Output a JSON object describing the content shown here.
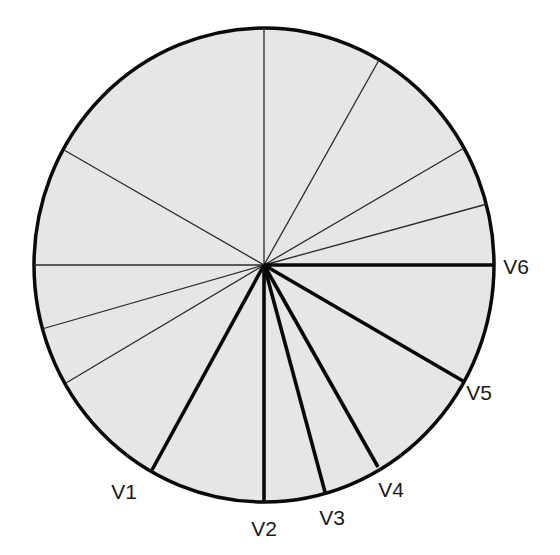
{
  "diagram": {
    "title": "",
    "center": [
      264,
      265
    ],
    "radius_x": 230,
    "radius_y": 237,
    "fill_color": "#e6e6e6",
    "outline_color": "#0a0a0a",
    "thin_spokes": [
      {
        "end": [
          264,
          27
        ]
      },
      {
        "end": [
          379,
          60
        ]
      },
      {
        "end": [
          464,
          148
        ]
      },
      {
        "end": [
          487,
          204
        ]
      },
      {
        "end": [
          64,
          150
        ]
      },
      {
        "end": [
          34,
          265
        ]
      },
      {
        "end": [
          42,
          329
        ]
      },
      {
        "end": [
          66,
          383
        ]
      }
    ],
    "leads": [
      {
        "label": "V1",
        "end": [
          152,
          470
        ],
        "label_pos": [
          124,
          491
        ]
      },
      {
        "label": "V2",
        "end": [
          264,
          501
        ],
        "label_pos": [
          264,
          528
        ]
      },
      {
        "label": "V3",
        "end": [
          325,
          492
        ],
        "label_pos": [
          332,
          517
        ]
      },
      {
        "label": "V4",
        "end": [
          378,
          467
        ],
        "label_pos": [
          391,
          489
        ]
      },
      {
        "label": "V5",
        "end": [
          463,
          381
        ],
        "label_pos": [
          479,
          392
        ]
      },
      {
        "label": "V6",
        "end": [
          494,
          265
        ],
        "label_pos": [
          516,
          266
        ]
      }
    ]
  }
}
